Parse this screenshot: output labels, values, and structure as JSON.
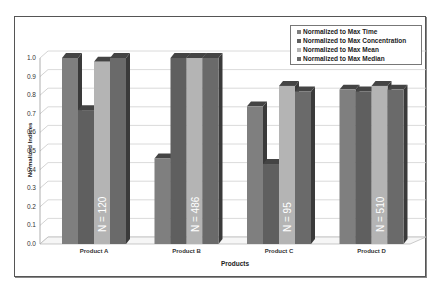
{
  "chart_data": {
    "type": "bar",
    "title": "",
    "xlabel": "Products",
    "ylabel": "Normalized Indices",
    "ylim": [
      0,
      1.0
    ],
    "yticks": [
      "0.0",
      "0.1",
      "0.2",
      "0.3",
      "0.4",
      "0.5",
      "0.6",
      "0.7",
      "0.8",
      "0.9",
      "1.0"
    ],
    "categories": [
      "Product A",
      "Product B",
      "Product C",
      "Product D"
    ],
    "series": [
      {
        "name": "Normalized to Max Time",
        "color": "#7f7f7f",
        "values": [
          1.0,
          0.46,
          0.74,
          0.83
        ]
      },
      {
        "name": "Normalized to Max Concentration",
        "color": "#5f5f5f",
        "values": [
          0.72,
          1.0,
          0.43,
          0.82
        ]
      },
      {
        "name": "Normalized to Max Mean",
        "color": "#b4b4b4",
        "values": [
          0.98,
          1.0,
          0.85,
          0.85
        ]
      },
      {
        "name": "Normalized to Max Median",
        "color": "#6a6a6a",
        "values": [
          1.0,
          1.0,
          0.82,
          0.83
        ]
      }
    ],
    "annotations": [
      "N = 120",
      "N = 486",
      "N = 95",
      "N = 510"
    ],
    "grid": true,
    "legend_position": "top-right",
    "style": "3d-clustered-column"
  }
}
